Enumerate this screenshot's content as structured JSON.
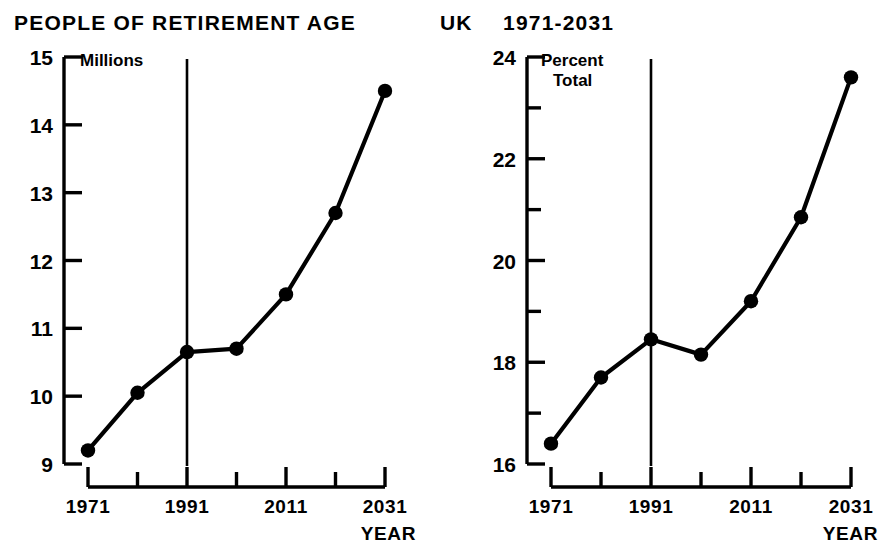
{
  "header": {
    "title_left": "PEOPLE  OF  RETIREMENT  AGE",
    "region": "UK",
    "period": "1971-2031"
  },
  "colors": {
    "ink": "#000000",
    "background": "#ffffff"
  },
  "chart_data": [
    {
      "id": "millions",
      "type": "line",
      "title": "PEOPLE  OF  RETIREMENT  AGE",
      "xlabel": "YEAR",
      "ylabel": "Millions",
      "x": [
        1971,
        1981,
        1991,
        2001,
        2011,
        2021,
        2031
      ],
      "values": [
        9.2,
        10.05,
        10.65,
        10.7,
        11.5,
        12.7,
        14.5
      ],
      "xlim": [
        1971,
        2031
      ],
      "ylim": [
        9,
        15
      ],
      "ytick_labels": [
        "15",
        "14",
        "13",
        "12",
        "11",
        "10",
        "9"
      ],
      "yticks": [
        15,
        14,
        13,
        12,
        11,
        10,
        9
      ],
      "yminor": [],
      "xticks": [
        1971,
        1981,
        1991,
        2001,
        2011,
        2021,
        2031
      ],
      "xtick_labels": [
        "1971",
        "",
        "1991",
        "",
        "2011",
        "",
        "2031"
      ],
      "grid": false,
      "legend": "none",
      "annotations": [
        {
          "name": "projection-divider",
          "x": 1991,
          "label": ""
        }
      ],
      "marker": "filled-circle"
    },
    {
      "id": "percent-total",
      "type": "line",
      "title": "UK  1971-2031",
      "xlabel": "YEAR",
      "ylabel": "Percent Total",
      "ylabel_line1": "Percent",
      "ylabel_line2": "Total",
      "x": [
        1971,
        1981,
        1991,
        2001,
        2011,
        2021,
        2031
      ],
      "values": [
        16.4,
        17.7,
        18.45,
        18.15,
        19.2,
        20.85,
        23.6
      ],
      "xlim": [
        1971,
        2031
      ],
      "ylim": [
        16,
        24
      ],
      "ytick_labels": [
        "24",
        "22",
        "20",
        "18",
        "16"
      ],
      "yticks": [
        24,
        22,
        20,
        18,
        16
      ],
      "yminor": [
        23,
        21,
        19,
        17
      ],
      "xticks": [
        1971,
        1981,
        1991,
        2001,
        2011,
        2021,
        2031
      ],
      "xtick_labels": [
        "1971",
        "",
        "1991",
        "",
        "2011",
        "",
        "2031"
      ],
      "grid": false,
      "legend": "none",
      "annotations": [
        {
          "name": "projection-divider",
          "x": 1991,
          "label": ""
        }
      ],
      "marker": "filled-circle"
    }
  ]
}
